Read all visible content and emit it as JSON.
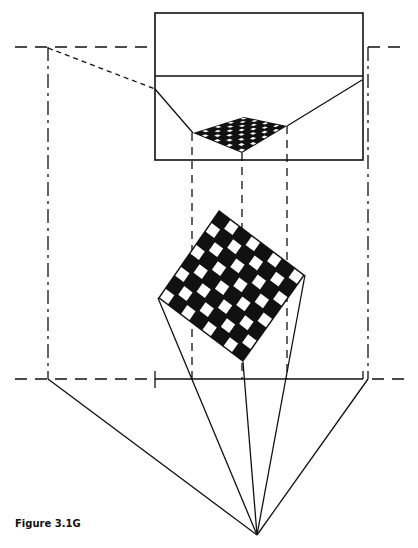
{
  "figure": {
    "caption": "Figure 3.1G",
    "ink_color": "#111111",
    "background": "#ffffff"
  },
  "picture_plane_view": {
    "rect": {
      "x": 155,
      "y": 13,
      "w": 208,
      "h": 147
    },
    "horizon_y": 76
  },
  "perspective_checkerboard": {
    "corners": [
      [
        193,
        133
      ],
      [
        244,
        117
      ],
      [
        287,
        126
      ],
      [
        242,
        153
      ]
    ],
    "grid": 8
  },
  "plan_checkerboard": {
    "corners": [
      [
        219,
        210
      ],
      [
        305,
        275
      ],
      [
        243,
        362
      ],
      [
        158,
        298
      ]
    ],
    "grid": 8
  },
  "station_point": [
    257,
    535
  ],
  "horizon_line_y": 47,
  "ground_line_y": 379,
  "picture_plane_line": {
    "x1": 155,
    "x2": 363,
    "y": 379
  }
}
